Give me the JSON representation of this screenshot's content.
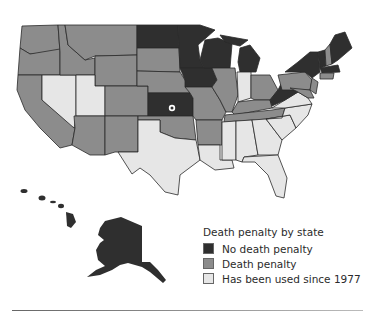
{
  "legend": {
    "title": "Death penalty by state",
    "items": [
      {
        "label": "No death penalty",
        "color": "#2f2f2f"
      },
      {
        "label": "Death penalty",
        "color": "#8c8c8c"
      },
      {
        "label": "Has been used since 1977",
        "color": "#e6e6e6"
      }
    ]
  },
  "colors": {
    "none": "#2f2f2f",
    "dp": "#8c8c8c",
    "used": "#e6e6e6",
    "border": "#2a2a2a"
  },
  "states": {
    "no_death_penalty": [
      "MN",
      "WI",
      "MI",
      "IA",
      "ND",
      "KS",
      "WV",
      "NY",
      "ME",
      "VT",
      "MA",
      "RI",
      "HI",
      "AK"
    ],
    "death_penalty": [
      "WA",
      "OR",
      "CA",
      "ID",
      "MT",
      "WY",
      "SD",
      "NE",
      "CO",
      "AZ",
      "NM",
      "OK",
      "MO",
      "IL",
      "OH",
      "KY",
      "TN",
      "AR",
      "PA",
      "NJ",
      "NH",
      "CT",
      "MD",
      "DE"
    ],
    "used_since_1977": [
      "NV",
      "UT",
      "TX",
      "LA",
      "MS",
      "AL",
      "GA",
      "FL",
      "SC",
      "NC",
      "VA",
      "IN"
    ]
  }
}
